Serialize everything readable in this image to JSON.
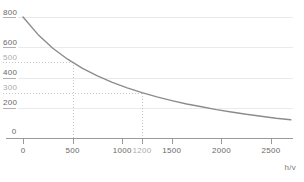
{
  "chart_data": {
    "type": "line",
    "title": "",
    "xlabel": "h/v",
    "ylabel": "",
    "xlim": [
      0,
      2720
    ],
    "ylim": [
      0,
      912
    ],
    "grid": "horizontal",
    "legend": "none",
    "x_ticks": [
      {
        "value": 0,
        "label": "0",
        "muted": false
      },
      {
        "value": 500,
        "label": "500",
        "muted": false
      },
      {
        "value": 1000,
        "label": "1000",
        "muted": false
      },
      {
        "value": 1200,
        "label": "1200",
        "muted": true
      },
      {
        "value": 1500,
        "label": "1500",
        "muted": false
      },
      {
        "value": 2000,
        "label": "2000",
        "muted": false
      },
      {
        "value": 2500,
        "label": "2500",
        "muted": false
      }
    ],
    "y_ticks": [
      {
        "value": 800,
        "label": "800",
        "muted": false,
        "style": "solid"
      },
      {
        "value": 600,
        "label": "600",
        "muted": false,
        "style": "solid"
      },
      {
        "value": 500,
        "label": "500",
        "muted": true,
        "style": "dotted"
      },
      {
        "value": 400,
        "label": "400",
        "muted": false,
        "style": "solid"
      },
      {
        "value": 300,
        "label": "300",
        "muted": true,
        "style": "dotted"
      },
      {
        "value": 200,
        "label": "200",
        "muted": false,
        "style": "solid"
      },
      {
        "value": 0,
        "label": "0",
        "muted": false,
        "style": "axis"
      }
    ],
    "guides": [
      {
        "x": 500,
        "y": 500
      },
      {
        "x": 1200,
        "y": 300
      }
    ],
    "series": [
      {
        "name": "decay-curve",
        "points": [
          [
            0,
            800
          ],
          [
            150,
            685
          ],
          [
            300,
            594
          ],
          [
            450,
            521
          ],
          [
            600,
            461
          ],
          [
            750,
            411
          ],
          [
            900,
            368
          ],
          [
            1050,
            332
          ],
          [
            1200,
            300
          ],
          [
            1350,
            272
          ],
          [
            1500,
            247
          ],
          [
            1650,
            225
          ],
          [
            1800,
            206
          ],
          [
            1950,
            188
          ],
          [
            2100,
            172
          ],
          [
            2250,
            157
          ],
          [
            2400,
            144
          ],
          [
            2550,
            131
          ],
          [
            2700,
            120
          ]
        ]
      }
    ]
  },
  "colors": {
    "background": "#ffffff",
    "curve": "#8c8c8c",
    "axis": "#9a9a9a",
    "grid": "#eaeaea",
    "grid_label_dash": "#b2b2b2",
    "guide": "#c6c6c6",
    "label": "#686868",
    "label_muted": "#ababab",
    "unit_label": "#7a7a7a"
  }
}
